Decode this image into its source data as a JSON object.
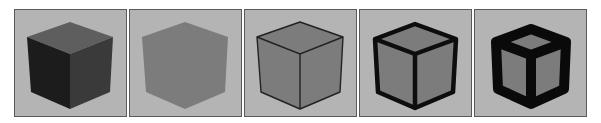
{
  "figure": {
    "panels": [
      {
        "id": 1,
        "description": "shaded cube, dark faces",
        "style": "shaded"
      },
      {
        "id": 2,
        "description": "flat uniform gray cube, no edges",
        "style": "flat"
      },
      {
        "id": 3,
        "description": "flat cube with thin dark outlines",
        "style": "thin-outline"
      },
      {
        "id": 4,
        "description": "flat cube with thick black outlines",
        "style": "thick-outline"
      },
      {
        "id": 5,
        "description": "flat cube with very thick black outlines",
        "style": "very-thick-outline"
      }
    ],
    "colors": {
      "background": "#b4b4b4",
      "frame": "#5a5a5a",
      "cube_gray": "#7c7c7c",
      "cube_top_shaded": "#5e5e5e",
      "cube_left_shaded": "#1c1c1c",
      "cube_right_shaded": "#3a3a3a",
      "edge": "#111111"
    }
  }
}
